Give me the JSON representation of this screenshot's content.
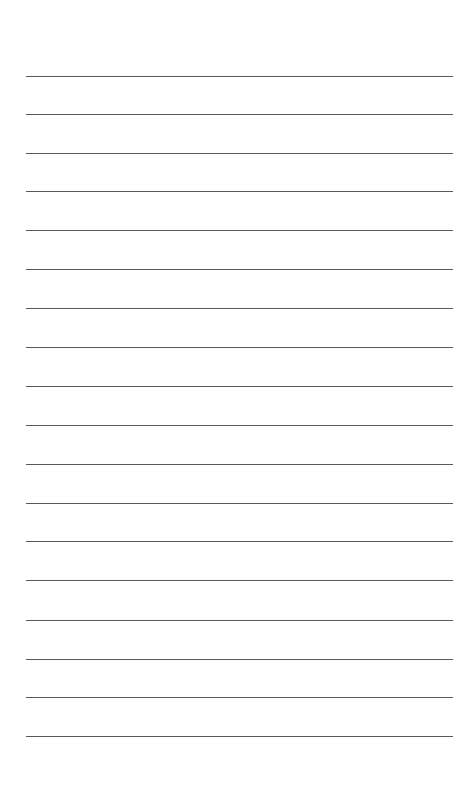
{
  "page": {
    "type": "lined-paper",
    "background_color": "#ffffff",
    "line_color": "#5a5a5a",
    "line_count": 18,
    "lines": [
      {
        "y": 76
      },
      {
        "y": 114
      },
      {
        "y": 153
      },
      {
        "y": 191
      },
      {
        "y": 230
      },
      {
        "y": 269
      },
      {
        "y": 308
      },
      {
        "y": 347
      },
      {
        "y": 386
      },
      {
        "y": 425
      },
      {
        "y": 464
      },
      {
        "y": 503
      },
      {
        "y": 541
      },
      {
        "y": 580
      },
      {
        "y": 620
      },
      {
        "y": 659
      },
      {
        "y": 697
      },
      {
        "y": 736
      }
    ]
  }
}
